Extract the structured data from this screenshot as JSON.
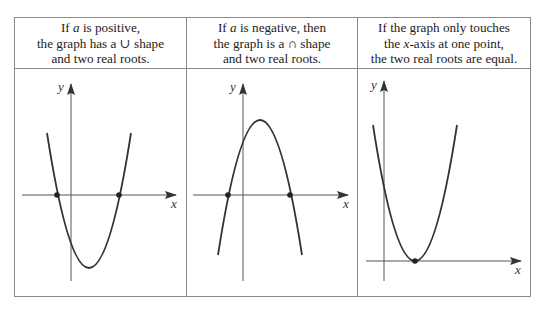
{
  "columns": [
    {
      "id": "positive",
      "lines": [
        {
          "pre": "If ",
          "var": "a",
          "post": " is positive,"
        },
        {
          "pre": "the graph has a ∪ shape",
          "var": "",
          "post": ""
        },
        {
          "pre": "and two real roots.",
          "var": "",
          "post": ""
        }
      ]
    },
    {
      "id": "negative",
      "lines": [
        {
          "pre": "If ",
          "var": "a",
          "post": " is negative, then"
        },
        {
          "pre": "the graph is a ∩ shape",
          "var": "",
          "post": ""
        },
        {
          "pre": "and two real roots.",
          "var": "",
          "post": ""
        }
      ]
    },
    {
      "id": "touching",
      "lines": [
        {
          "pre": "If the graph only touches",
          "var": "",
          "post": ""
        },
        {
          "pre": "the ",
          "var": "x",
          "post": "-axis at one point,"
        },
        {
          "pre": "the two real roots are equal.",
          "var": "",
          "post": ""
        }
      ]
    }
  ],
  "axes": {
    "x_label": "x",
    "y_label": "y"
  },
  "graphs": [
    {
      "shape": "upward parabola",
      "roots": 2,
      "root_points": [
        [
          57,
          195
        ],
        [
          119,
          195
        ]
      ],
      "vertex": [
        89,
        268
      ]
    },
    {
      "shape": "downward parabola",
      "roots": 2,
      "root_points": [
        [
          228,
          195
        ],
        [
          290,
          195
        ]
      ],
      "vertex": [
        260,
        120
      ]
    },
    {
      "shape": "upward parabola touching x-axis",
      "roots": 1,
      "root_points": [
        [
          415,
          261
        ]
      ],
      "vertex": [
        415,
        261
      ]
    }
  ],
  "colors": {
    "border": "#8a8a8a",
    "curve": "#333333",
    "axis": "#444444"
  }
}
